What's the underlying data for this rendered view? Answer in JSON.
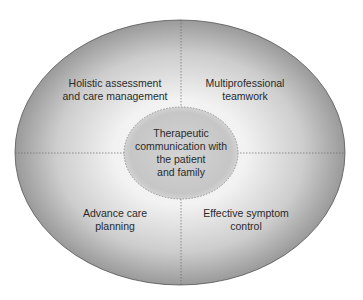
{
  "diagram": {
    "center": {
      "lines": [
        "Therapeutic",
        "communication with",
        "the patient",
        "and family"
      ]
    },
    "quadrants": [
      {
        "position": "top-left",
        "lines": [
          "Holistic assessment",
          "and care management"
        ]
      },
      {
        "position": "top-right",
        "lines": [
          "Multiprofessional",
          "teamwork"
        ]
      },
      {
        "position": "bottom-left",
        "lines": [
          "Advance care",
          "planning"
        ]
      },
      {
        "position": "bottom-right",
        "lines": [
          "Effective symptom",
          "control"
        ]
      }
    ],
    "colors": {
      "outer_edge": "#9a9a9a",
      "outer_glow": "#f2f2f2",
      "inner_fill": "#c9c9c9",
      "text": "#2a2a2a",
      "divider": "#6a6a6a"
    }
  }
}
